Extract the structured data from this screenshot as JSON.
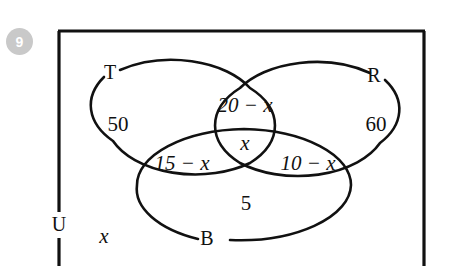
{
  "question": {
    "number": "9"
  },
  "diagram": {
    "type": "venn-three-set",
    "universal_set_label": "U",
    "sets": [
      {
        "id": "T",
        "label": "T",
        "position": "top-left-ellipse"
      },
      {
        "id": "R",
        "label": "R",
        "position": "top-right-ellipse"
      },
      {
        "id": "B",
        "label": "B",
        "position": "bottom-ellipse"
      }
    ],
    "regions": [
      {
        "id": "T-only",
        "label": "50",
        "description": "T only"
      },
      {
        "id": "R-only",
        "label": "60",
        "description": "R only"
      },
      {
        "id": "B-only",
        "label": "5",
        "description": "B only"
      },
      {
        "id": "T-and-R",
        "label": "20 − x",
        "description": "T and R, not B"
      },
      {
        "id": "T-and-B",
        "label": "15 − x",
        "description": "T and B, not R"
      },
      {
        "id": "R-and-B",
        "label": "10 − x",
        "description": "R and B, not T"
      },
      {
        "id": "T-R-B",
        "label": "x",
        "description": "T and R and B"
      },
      {
        "id": "outside-all",
        "label": "x",
        "description": "outside all three sets, inside U"
      }
    ]
  },
  "colors": {
    "ink": "#111111",
    "badge_background": "#c9c9c9",
    "badge_text": "#ffffff",
    "page_background": "#ffffff"
  }
}
